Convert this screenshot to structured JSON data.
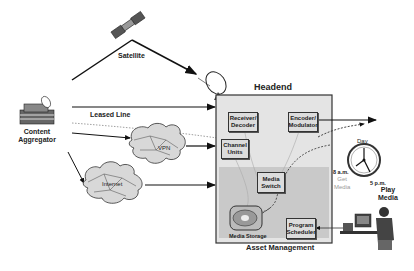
{
  "diagram": {
    "satellite_label": "Satellite",
    "source_label": "Content\nAggregator",
    "leased_line_label": "Leased Line",
    "vpn_label": "VPN",
    "internet_label": "Internet",
    "headend": {
      "title": "Headend",
      "components": {
        "receiver_decoder": "Receiver/\nDecoder",
        "encoder_modulator": "Encoder/\nModulator",
        "channel_units": "Channel\nUnits",
        "media_switch": "Media\nSwitch",
        "media_storage": "Media Storage",
        "program_scheduler": "Program\nScheduler"
      },
      "asset_management_label": "Asset Management"
    },
    "schedule": {
      "day_label": "Day",
      "am_label": "8 a.m.",
      "get_media_label": "Get\nMedia",
      "pm_label": "5 p.m.",
      "play_media_label": "Play\nMedia"
    }
  }
}
